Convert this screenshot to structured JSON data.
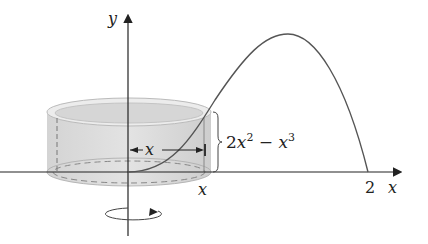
{
  "diagram": {
    "axes": {
      "y_label": "y",
      "x_label": "x"
    },
    "labels": {
      "radius": "x",
      "height_base": "2x",
      "height_sup1": "2",
      "height_minus": " − x",
      "height_sup2": "3",
      "x_tick": "x",
      "two_tick": "2"
    },
    "curve": "y = 2x^2 - x^3",
    "x_intercepts": [
      0,
      2
    ],
    "colors": {
      "axis": "#222222",
      "curve": "#555555",
      "shell_fill": "#d4d4d4",
      "shell_top": "#e6e6e6"
    }
  }
}
